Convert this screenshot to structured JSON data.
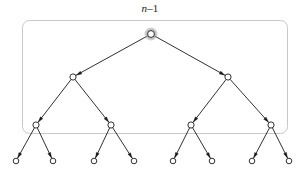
{
  "figure": {
    "kind": "binary-tree-diagram",
    "label": {
      "text": "n–1",
      "variable": "n",
      "suffix": "–1"
    },
    "colors": {
      "node_stroke": "#1a1a1a",
      "node_fill": "#ffffff",
      "edge": "#1a1a1a",
      "box_border": "#c8c8c8",
      "root_halo": "#a8a8a8",
      "background": "#ffffff"
    },
    "bounding_box": {
      "x": 22,
      "y": 20,
      "width": 265,
      "height": 113,
      "radius": 7,
      "stroke": "#c8c8c8",
      "stroke_width": 1
    },
    "geometry": {
      "node_radius": 3.1,
      "leaf_radius": 2.8,
      "root_radius": 3.4,
      "root_halo_radius": 5.2,
      "edge_width": 0.9,
      "arrow_length": 5.5,
      "arrow_width": 3.2
    },
    "levels": [
      {
        "depth": 0,
        "y": 34,
        "count": 1,
        "highlighted": true
      },
      {
        "depth": 1,
        "y": 77,
        "count": 2,
        "highlighted": false
      },
      {
        "depth": 2,
        "y": 125,
        "count": 4,
        "highlighted": false
      },
      {
        "depth": 3,
        "y": 161,
        "count": 8,
        "highlighted": false
      }
    ],
    "nodes": [
      {
        "id": "r",
        "depth": 0,
        "x": 151,
        "y": 34,
        "halo": true
      },
      {
        "id": "a",
        "depth": 1,
        "x": 73,
        "y": 77,
        "halo": false
      },
      {
        "id": "b",
        "depth": 1,
        "x": 228,
        "y": 77,
        "halo": false
      },
      {
        "id": "c",
        "depth": 2,
        "x": 36,
        "y": 125,
        "halo": false
      },
      {
        "id": "d",
        "depth": 2,
        "x": 111,
        "y": 125,
        "halo": false
      },
      {
        "id": "e",
        "depth": 2,
        "x": 191,
        "y": 125,
        "halo": false
      },
      {
        "id": "f",
        "depth": 2,
        "x": 271,
        "y": 125,
        "halo": false
      },
      {
        "id": "g1",
        "depth": 3,
        "x": 16,
        "y": 161,
        "halo": false
      },
      {
        "id": "g2",
        "depth": 3,
        "x": 53,
        "y": 161,
        "halo": false
      },
      {
        "id": "g3",
        "depth": 3,
        "x": 94,
        "y": 161,
        "halo": false
      },
      {
        "id": "g4",
        "depth": 3,
        "x": 134,
        "y": 161,
        "halo": false
      },
      {
        "id": "g5",
        "depth": 3,
        "x": 173,
        "y": 161,
        "halo": false
      },
      {
        "id": "g6",
        "depth": 3,
        "x": 212,
        "y": 161,
        "halo": false
      },
      {
        "id": "g7",
        "depth": 3,
        "x": 252,
        "y": 161,
        "halo": false
      },
      {
        "id": "g8",
        "depth": 3,
        "x": 289,
        "y": 161,
        "halo": false
      }
    ],
    "edges": [
      {
        "from": "r",
        "to": "a",
        "arrow": "to"
      },
      {
        "from": "r",
        "to": "b",
        "arrow": "to"
      },
      {
        "from": "a",
        "to": "c",
        "arrow": "to"
      },
      {
        "from": "a",
        "to": "d",
        "arrow": "to"
      },
      {
        "from": "b",
        "to": "e",
        "arrow": "to"
      },
      {
        "from": "b",
        "to": "f",
        "arrow": "to"
      },
      {
        "from": "c",
        "to": "g1",
        "arrow": "to"
      },
      {
        "from": "c",
        "to": "g2",
        "arrow": "to"
      },
      {
        "from": "d",
        "to": "g3",
        "arrow": "to"
      },
      {
        "from": "d",
        "to": "g4",
        "arrow": "to"
      },
      {
        "from": "e",
        "to": "g5",
        "arrow": "to"
      },
      {
        "from": "e",
        "to": "g6",
        "arrow": "to"
      },
      {
        "from": "f",
        "to": "g7",
        "arrow": "to"
      },
      {
        "from": "f",
        "to": "g8",
        "arrow": "to"
      }
    ]
  }
}
